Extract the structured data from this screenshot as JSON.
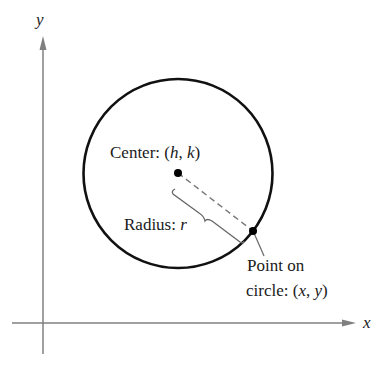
{
  "axes": {
    "x_label": "x",
    "y_label": "y",
    "axis_color": "#777777"
  },
  "circle": {
    "stroke_color": "#111111"
  },
  "labels": {
    "center_prefix": "Center: (",
    "center_h": "h",
    "center_sep": ", ",
    "center_k": "k",
    "center_suffix": ")",
    "radius_prefix": "Radius: ",
    "radius_r": "r",
    "point_line1": "Point on",
    "point_line2_prefix": "circle: (",
    "point_x": "x",
    "point_sep": ", ",
    "point_y": "y",
    "point_line2_suffix": ")"
  }
}
